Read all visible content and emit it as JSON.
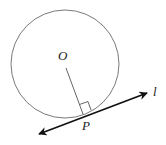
{
  "diagram": {
    "labels": {
      "center": "O",
      "tangent_point": "P",
      "line": "l"
    },
    "elements": [
      {
        "type": "circle",
        "name": "circle",
        "center": "O"
      },
      {
        "type": "segment",
        "name": "radius",
        "from": "O",
        "to": "P"
      },
      {
        "type": "line",
        "name": "tangent-line",
        "label": "l",
        "through": "P",
        "arrows": "both"
      },
      {
        "type": "right-angle-mark",
        "at": "P",
        "between": [
          "radius",
          "tangent-line"
        ]
      }
    ],
    "colors": {
      "circle": "#7a7a7a",
      "radius": "#555555",
      "tangent": "#111111",
      "text": "#222222"
    }
  }
}
